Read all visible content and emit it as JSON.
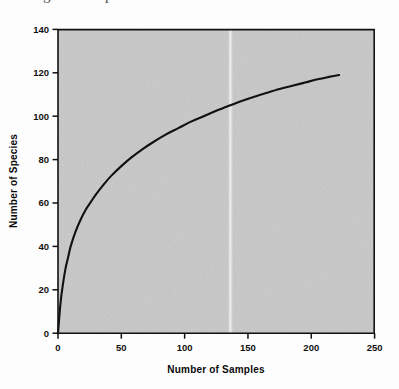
{
  "page": {
    "background_color": "#ffffff",
    "clipped_caption_text": "igure 5. Species accumulation curve"
  },
  "chart_data": {
    "type": "line",
    "title": "",
    "subtitle": "",
    "xlabel": "Number of Samples",
    "ylabel": "Number of Species",
    "xlim": [
      0,
      250
    ],
    "ylim": [
      0,
      140
    ],
    "xticks": [
      0,
      50,
      100,
      150,
      200,
      250
    ],
    "yticks": [
      0,
      20,
      40,
      60,
      80,
      100,
      120,
      140
    ],
    "xtick_labels": [
      "0",
      "50",
      "100",
      "150",
      "200",
      "250"
    ],
    "ytick_labels": [
      "0",
      "20",
      "40",
      "60",
      "80",
      "100",
      "120",
      "140"
    ],
    "grid": false,
    "legend": false,
    "legend_position": "none",
    "plot_background_color": "#c8c8c8",
    "line_color": "#111111",
    "line_width_px": 2.1,
    "series": [
      {
        "name": "Species accumulation",
        "x": [
          0,
          2,
          4,
          6,
          8,
          10,
          14,
          18,
          22,
          26,
          30,
          36,
          42,
          50,
          58,
          66,
          75,
          85,
          95,
          105,
          115,
          125,
          135,
          145,
          155,
          165,
          175,
          185,
          195,
          205,
          213,
          222
        ],
        "y": [
          0,
          14,
          23,
          30,
          35,
          40,
          47,
          52.5,
          57,
          60.5,
          64,
          68.5,
          72.5,
          77,
          81,
          84.5,
          88,
          91.5,
          94.5,
          97.5,
          100,
          102.5,
          104.8,
          107,
          109,
          110.8,
          112.5,
          114,
          115.5,
          117,
          118,
          119
        ]
      }
    ],
    "annotations": []
  },
  "artifacts": {
    "scan_streak_label": "vertical-white-scan-streak",
    "scan_streak_x_data": 136
  }
}
